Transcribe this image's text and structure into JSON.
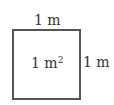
{
  "diagram": {
    "shape": "square",
    "top_label": "1 m",
    "right_label": "1 m",
    "area_label": {
      "base": "1 m",
      "exponent": "2"
    },
    "colors": {
      "stroke": "#555555",
      "text": "#333333",
      "background": "#ffffff"
    }
  }
}
